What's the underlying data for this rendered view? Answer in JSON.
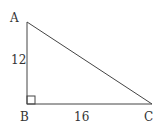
{
  "diagram": {
    "type": "right-triangle",
    "vertices": {
      "A": {
        "label": "A",
        "x": 27,
        "y": 22
      },
      "B": {
        "label": "B",
        "x": 27,
        "y": 104
      },
      "C": {
        "label": "C",
        "x": 152,
        "y": 104
      }
    },
    "sides": {
      "AB": {
        "label": "12"
      },
      "BC": {
        "label": "16"
      }
    },
    "right_angle_at": "B",
    "stroke_color": "#444444"
  }
}
